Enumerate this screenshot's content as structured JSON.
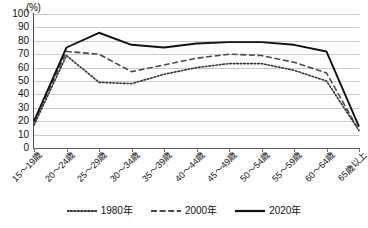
{
  "chart_data": {
    "type": "line",
    "title": "",
    "subtitle": "",
    "xlabel": "",
    "ylabel": "",
    "unit_label": "(%)",
    "ylim": [
      0,
      100
    ],
    "ytick_step": 10,
    "yticks": [
      "100",
      "90",
      "80",
      "70",
      "60",
      "50",
      "40",
      "30",
      "20",
      "10",
      "0"
    ],
    "ytick_values": [
      100,
      90,
      80,
      70,
      60,
      50,
      40,
      30,
      20,
      10,
      0
    ],
    "grid": true,
    "grid_axis": "y",
    "legend_position": "bottom-center",
    "categories": [
      "15〜19歳",
      "20〜24歳",
      "25〜29歳",
      "30〜34歳",
      "35〜39歳",
      "40〜44歳",
      "45〜49歳",
      "50〜54歳",
      "55〜59歳",
      "60〜64歳",
      "65歳以上"
    ],
    "series": [
      {
        "name": "1980年",
        "style": "dotted",
        "color": "#333333",
        "values": [
          17,
          69,
          49,
          48,
          55,
          60,
          63,
          63,
          58,
          50,
          13
        ]
      },
      {
        "name": "2000年",
        "style": "dashed",
        "color": "#4a4a4a",
        "values": [
          19,
          72,
          70,
          57,
          62,
          67,
          70,
          69,
          64,
          56,
          13
        ]
      },
      {
        "name": "2020年",
        "style": "solid",
        "color": "#111111",
        "values": [
          20,
          75,
          86,
          77,
          75,
          78,
          79,
          79,
          77,
          72,
          16
        ]
      }
    ]
  },
  "legend": {
    "items": [
      {
        "label": "1980年",
        "style": "dotted"
      },
      {
        "label": "2000年",
        "style": "dashed"
      },
      {
        "label": "2020年",
        "style": "solid"
      }
    ]
  },
  "colors": {
    "gridline": "#c9c9c9",
    "axis": "#4a4a4a",
    "background": "#ffffff",
    "text": "#111111"
  }
}
